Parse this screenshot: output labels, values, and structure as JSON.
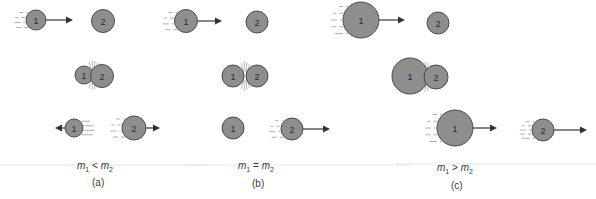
{
  "figure": {
    "colors": {
      "ball_fill": "#8e8e8e",
      "ball_stroke": "#4a4a4a",
      "arrow": "#333333",
      "text": "#3a3a3a"
    },
    "panels": [
      {
        "id": "a",
        "label": "(a)",
        "relation": {
          "lhs": "m",
          "lhs_sub": "1",
          "op": "<",
          "rhs": "m",
          "rhs_sub": "2"
        },
        "relation_pos": {
          "x": 77,
          "y": 160
        },
        "label_pos": {
          "x": 92,
          "y": 177
        },
        "baseline": {
          "x1": 0,
          "x2": 205,
          "y": 165
        },
        "stages": [
          {
            "name": "before",
            "balls": [
              {
                "num": "1",
                "cx": 36,
                "cy": 20,
                "r": 10,
                "arrow": {
                  "to": 73,
                  "dir": "right"
                },
                "speed": {
                  "side": "left",
                  "count": 4
                }
              },
              {
                "num": "2",
                "cx": 103,
                "cy": 21,
                "r": 11.5
              }
            ]
          },
          {
            "name": "collision",
            "impact": {
              "x": 93,
              "y": 75
            },
            "balls": [
              {
                "num": "1",
                "cx": 84,
                "cy": 75,
                "r": 9
              },
              {
                "num": "2",
                "cx": 102,
                "cy": 76,
                "r": 11.5
              }
            ]
          },
          {
            "name": "after",
            "balls": [
              {
                "num": "1",
                "cx": 74,
                "cy": 128,
                "r": 9,
                "arrow": {
                  "to": 55,
                  "dir": "left"
                },
                "speed": {
                  "side": "right",
                  "count": 4
                }
              },
              {
                "num": "2",
                "cx": 134,
                "cy": 128,
                "r": 12,
                "arrow": {
                  "to": 160,
                  "dir": "right"
                },
                "speed": {
                  "side": "left",
                  "count": 4
                }
              }
            ]
          }
        ]
      },
      {
        "id": "b",
        "label": "(b)",
        "relation": {
          "lhs": "m",
          "lhs_sub": "1",
          "op": "=",
          "rhs": "m",
          "rhs_sub": "2"
        },
        "relation_pos": {
          "x": 238,
          "y": 160
        },
        "label_pos": {
          "x": 252,
          "y": 178
        },
        "baseline": {
          "x1": 190,
          "x2": 410,
          "y": 165
        },
        "stages": [
          {
            "name": "before",
            "balls": [
              {
                "num": "1",
                "cx": 186,
                "cy": 21,
                "r": 11.5,
                "arrow": {
                  "to": 222,
                  "dir": "right"
                },
                "speed": {
                  "side": "left",
                  "count": 4
                }
              },
              {
                "num": "2",
                "cx": 257,
                "cy": 22,
                "r": 11
              }
            ]
          },
          {
            "name": "collision",
            "impact": {
              "x": 245,
              "y": 76
            },
            "balls": [
              {
                "num": "1",
                "cx": 233,
                "cy": 76,
                "r": 11
              },
              {
                "num": "2",
                "cx": 257,
                "cy": 76,
                "r": 11
              }
            ]
          },
          {
            "name": "after",
            "balls": [
              {
                "num": "1",
                "cx": 233,
                "cy": 128,
                "r": 11
              },
              {
                "num": "2",
                "cx": 292,
                "cy": 129,
                "r": 11,
                "arrow": {
                  "to": 330,
                  "dir": "right"
                },
                "speed": {
                  "side": "left",
                  "count": 4
                }
              }
            ]
          }
        ]
      },
      {
        "id": "c",
        "label": "(c)",
        "relation": {
          "lhs": "m",
          "lhs_sub": "1",
          "op": ">",
          "rhs": "m",
          "rhs_sub": "2"
        },
        "relation_pos": {
          "x": 437,
          "y": 162
        },
        "label_pos": {
          "x": 451,
          "y": 180
        },
        "baseline": {
          "x1": 396,
          "x2": 596,
          "y": 164
        },
        "stages": [
          {
            "name": "before",
            "balls": [
              {
                "num": "1",
                "cx": 361,
                "cy": 20,
                "r": 18,
                "arrow": {
                  "to": 405,
                  "dir": "right"
                },
                "speed": {
                  "side": "left",
                  "count": 5
                }
              },
              {
                "num": "2",
                "cx": 438,
                "cy": 23,
                "r": 11
              }
            ]
          },
          {
            "name": "collision",
            "impact": {
              "x": 426,
              "y": 77
            },
            "balls": [
              {
                "num": "1",
                "cx": 410,
                "cy": 76,
                "r": 18
              },
              {
                "num": "2",
                "cx": 436,
                "cy": 77,
                "r": 12
              }
            ]
          },
          {
            "name": "after",
            "balls": [
              {
                "num": "1",
                "cx": 455,
                "cy": 128,
                "r": 18,
                "arrow": {
                  "to": 497,
                  "dir": "right"
                },
                "speed": {
                  "side": "left",
                  "count": 5
                }
              },
              {
                "num": "2",
                "cx": 543,
                "cy": 130,
                "r": 11,
                "arrow": {
                  "to": 587,
                  "dir": "right"
                },
                "speed": {
                  "side": "left",
                  "count": 5
                }
              }
            ]
          }
        ]
      }
    ]
  }
}
